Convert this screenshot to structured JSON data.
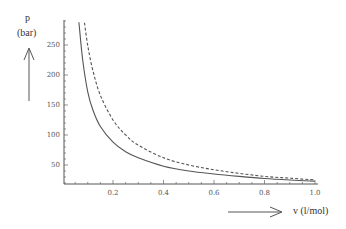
{
  "chart_data": {
    "type": "line",
    "title": "",
    "xlabel": "v (l/mol)",
    "ylabel": "p\n(bar)",
    "ylabel_line1": "p",
    "ylabel_line2": "(bar)",
    "xlim": [
      0.005,
      1.0
    ],
    "ylim": [
      18,
      292
    ],
    "x_ticks": [
      0.2,
      0.4,
      0.6,
      0.8,
      1.0
    ],
    "x_tick_labels": [
      "0.2",
      "0.4",
      "0.6",
      "0.8",
      "1.0"
    ],
    "y_ticks": [
      50,
      100,
      150,
      200,
      250
    ],
    "y_tick_labels": [
      "50",
      "100",
      "150",
      "200",
      "250"
    ],
    "grid": false,
    "legend": null,
    "series": [
      {
        "name": "solid",
        "style": "solid",
        "color": "#555555",
        "x": [
          0.065,
          0.08,
          0.1,
          0.12,
          0.15,
          0.2,
          0.25,
          0.3,
          0.4,
          0.5,
          0.6,
          0.7,
          0.8,
          0.9,
          1.0
        ],
        "y": [
          288,
          225,
          172,
          142,
          114,
          88,
          72,
          62,
          48,
          40,
          35,
          31,
          27.5,
          25,
          23
        ]
      },
      {
        "name": "dashed",
        "style": "dashed",
        "color": "#555555",
        "x": [
          0.087,
          0.1,
          0.12,
          0.15,
          0.2,
          0.25,
          0.3,
          0.4,
          0.5,
          0.6,
          0.7,
          0.8,
          0.9,
          1.0
        ],
        "y": [
          287,
          249,
          208,
          166,
          125,
          100,
          83,
          62,
          50,
          42,
          36,
          31,
          28,
          25
        ]
      }
    ],
    "annotations": [
      {
        "text": "arrow-up",
        "near": "ylabel"
      },
      {
        "text": "arrow-right",
        "near": "xlabel"
      }
    ]
  }
}
